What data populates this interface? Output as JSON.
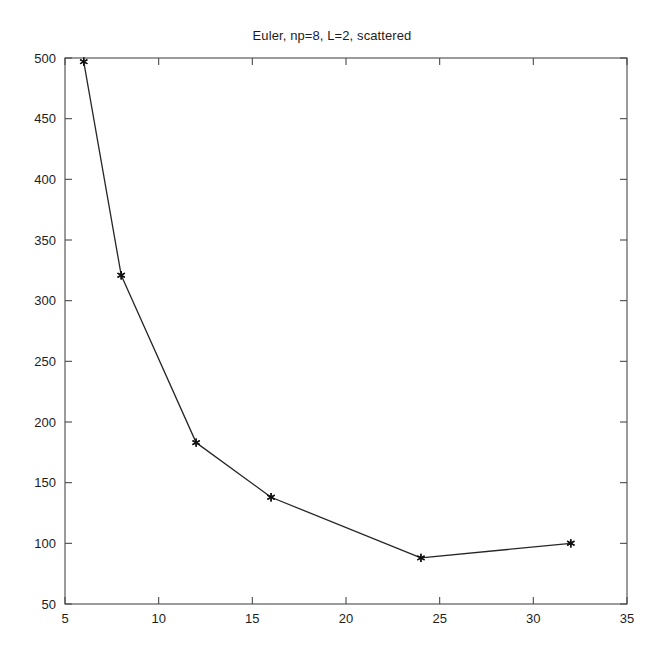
{
  "chart_data": {
    "type": "line",
    "title": "Euler, np=8, L=2, scattered",
    "xlabel": "",
    "ylabel": "",
    "x": [
      6,
      8,
      12,
      16,
      24,
      32
    ],
    "values": [
      497,
      321,
      183,
      138,
      88,
      100
    ],
    "series": [
      {
        "name": "Euler np=8 L=2 scattered",
        "x": [
          6,
          8,
          12,
          16,
          24,
          32
        ],
        "values": [
          497,
          321,
          183,
          138,
          88,
          100
        ],
        "marker": "asterisk",
        "line_color": "#262626",
        "marker_color": "#111111"
      }
    ],
    "xlim": [
      5,
      35
    ],
    "ylim": [
      50,
      500
    ],
    "xticks": [
      5,
      10,
      15,
      20,
      25,
      30,
      35
    ],
    "yticks": [
      50,
      100,
      150,
      200,
      250,
      300,
      350,
      400,
      450,
      500
    ],
    "xtick_labels": [
      "5",
      "10",
      "15",
      "20",
      "25",
      "30",
      "35"
    ],
    "ytick_labels": [
      "50",
      "100",
      "150",
      "200",
      "250",
      "300",
      "350",
      "400",
      "450",
      "500"
    ],
    "grid": false,
    "legend": null,
    "background": "#ffffff",
    "axis_color": "#4a4a4a"
  },
  "figure": {
    "title": "Euler, np=8, L=2, scattered"
  }
}
